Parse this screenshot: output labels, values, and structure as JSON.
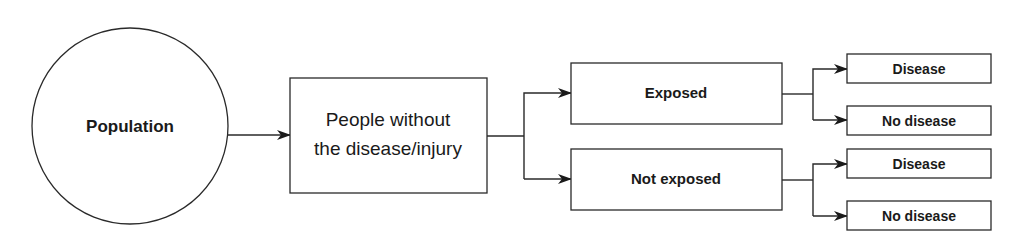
{
  "diagram": {
    "type": "flowchart",
    "nodes": {
      "population": {
        "label": "Population",
        "shape": "circle"
      },
      "people_without": {
        "label_line1": "People without",
        "label_line2": "the disease/injury",
        "shape": "rectangle"
      },
      "exposed": {
        "label": "Exposed",
        "shape": "rectangle"
      },
      "not_exposed": {
        "label": "Not exposed",
        "shape": "rectangle"
      },
      "exposed_disease": {
        "label": "Disease",
        "shape": "rectangle"
      },
      "exposed_no_disease": {
        "label": "No disease",
        "shape": "rectangle"
      },
      "not_exposed_disease": {
        "label": "Disease",
        "shape": "rectangle"
      },
      "not_exposed_no_disease": {
        "label": "No disease",
        "shape": "rectangle"
      }
    },
    "edges": [
      {
        "from": "population",
        "to": "people_without"
      },
      {
        "from": "people_without",
        "to": "exposed"
      },
      {
        "from": "people_without",
        "to": "not_exposed"
      },
      {
        "from": "exposed",
        "to": "exposed_disease"
      },
      {
        "from": "exposed",
        "to": "exposed_no_disease"
      },
      {
        "from": "not_exposed",
        "to": "not_exposed_disease"
      },
      {
        "from": "not_exposed",
        "to": "not_exposed_no_disease"
      }
    ],
    "colors": {
      "stroke": "#2a2a2a",
      "text": "#1a1a1a",
      "background": "#ffffff"
    }
  }
}
